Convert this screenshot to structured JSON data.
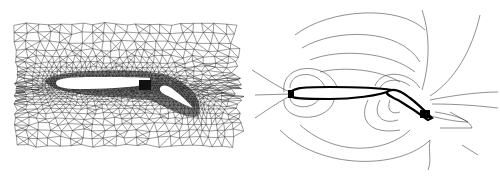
{
  "figure": {
    "panels": [
      {
        "id": "mesh",
        "description": "Unstructured triangular computational mesh around two-element airfoil (main wing + flap)",
        "bounds": {
          "x": 16,
          "y": 24,
          "width": 227,
          "height": 128
        },
        "colors": {
          "line": "#222222",
          "airfoil": "#ffffff",
          "background": "#ffffff"
        }
      },
      {
        "id": "contours",
        "description": "Flow-field contour lines around two-element airfoil",
        "colors": {
          "line": "#333333",
          "airfoil": "#000000",
          "background": "#ffffff"
        }
      }
    ]
  }
}
